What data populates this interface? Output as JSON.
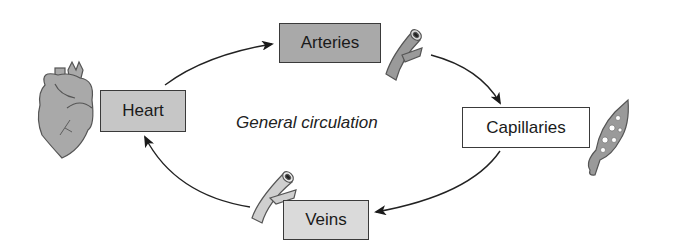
{
  "diagram": {
    "title": "General circulation",
    "nodes": [
      {
        "id": "heart",
        "label": "Heart",
        "fill": "#c6c6c6"
      },
      {
        "id": "arteries",
        "label": "Arteries",
        "fill": "#a9a9a9"
      },
      {
        "id": "capillaries",
        "label": "Capillaries",
        "fill": "#ffffff"
      },
      {
        "id": "veins",
        "label": "Veins",
        "fill": "#dadada"
      }
    ],
    "edges": [
      {
        "from": "heart",
        "to": "arteries"
      },
      {
        "from": "arteries",
        "to": "capillaries"
      },
      {
        "from": "capillaries",
        "to": "veins"
      },
      {
        "from": "veins",
        "to": "heart"
      }
    ],
    "icons": [
      "heart-organ-icon",
      "artery-vessel-icon",
      "capillary-bed-icon",
      "vein-vessel-icon"
    ]
  }
}
